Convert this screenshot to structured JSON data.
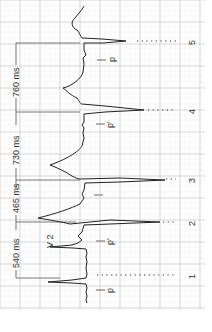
{
  "diagram": {
    "lead_label": "V 2",
    "intervals": [
      {
        "label": "540 ms",
        "from_beat": 1,
        "to_beat": 2
      },
      {
        "label": "465 ms",
        "from_beat": 2,
        "to_beat": 3
      },
      {
        "label": "730 ms",
        "from_beat": 3,
        "to_beat": 4
      },
      {
        "label": "760 ms",
        "from_beat": 4,
        "to_beat": 5
      }
    ],
    "beats": [
      {
        "number": "1",
        "p_label": "p"
      },
      {
        "number": "2",
        "p_label": "p'"
      },
      {
        "number": "3",
        "p_label": ""
      },
      {
        "number": "4",
        "p_label": "p'"
      },
      {
        "number": "5",
        "p_label": "p"
      }
    ],
    "colors": {
      "grid_major": "#b8b8b8",
      "grid_minor": "#e6e6e6",
      "trace": "#222222",
      "text": "#333333"
    }
  }
}
